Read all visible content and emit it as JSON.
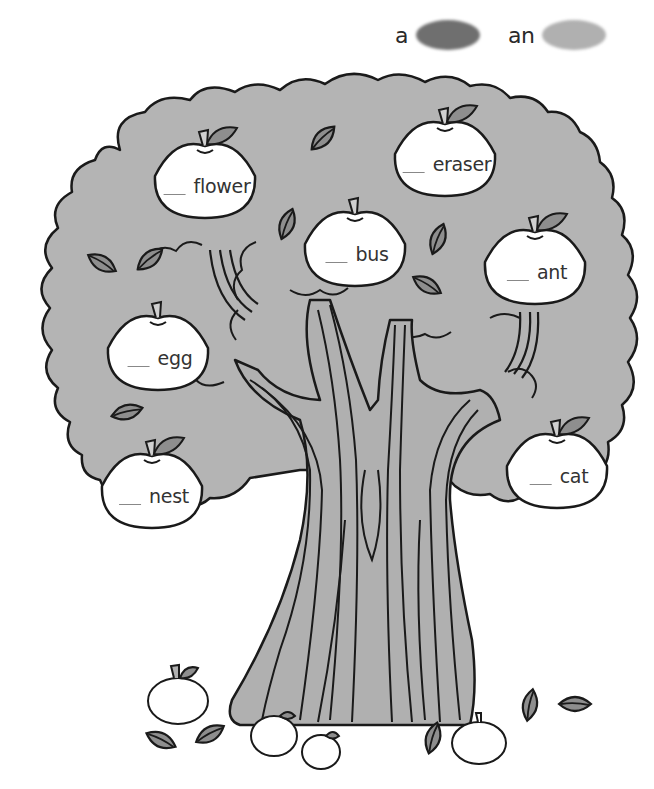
{
  "worksheet": {
    "type": "a / an color-by-article exercise",
    "legend": [
      {
        "label": "a",
        "color": "#6f6f6f",
        "meaning": "dark gray crayon"
      },
      {
        "label": "an",
        "color": "#b0b0b0",
        "meaning": "light gray crayon"
      }
    ],
    "apples": [
      {
        "id": "flower",
        "blank": "__",
        "word": "flower",
        "x": 205,
        "y": 180
      },
      {
        "id": "eraser",
        "blank": "__",
        "word": "eraser",
        "x": 445,
        "y": 158
      },
      {
        "id": "bus",
        "blank": "__",
        "word": "bus",
        "x": 355,
        "y": 248
      },
      {
        "id": "ant",
        "blank": "__",
        "word": "ant",
        "x": 535,
        "y": 266
      },
      {
        "id": "egg",
        "blank": "__",
        "word": "egg",
        "x": 158,
        "y": 352
      },
      {
        "id": "nest",
        "blank": "__",
        "word": "nest",
        "x": 152,
        "y": 490
      },
      {
        "id": "cat",
        "blank": "__",
        "word": "cat",
        "x": 557,
        "y": 470
      }
    ]
  },
  "colors": {
    "canopy": "#b4b4b4",
    "trunk": "#b0b0b0",
    "leaf": "#8e8e8e",
    "outline": "#1a1a1a",
    "apple": "#ffffff",
    "background": "#ffffff"
  }
}
